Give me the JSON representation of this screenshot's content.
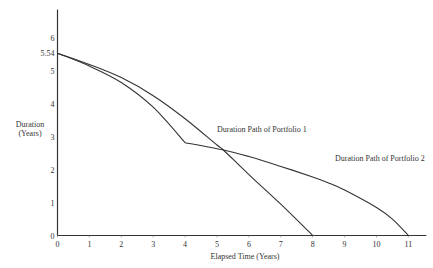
{
  "chart_data": {
    "type": "line",
    "title": "",
    "xlabel": "Elapsed Time (Years)",
    "ylabel_line1": "Duration",
    "ylabel_line2": "(Years)",
    "xlim": [
      0,
      11.5
    ],
    "ylim": [
      0,
      6.5
    ],
    "grid": false,
    "x_ticks": [
      0,
      1,
      2,
      3,
      4,
      5,
      6,
      7,
      8,
      9,
      10,
      11
    ],
    "x_tick_labels": [
      "0",
      "1",
      "2",
      "3",
      "4",
      "5",
      "6",
      "7",
      "8",
      "9",
      "10",
      "11"
    ],
    "y_ticks": [
      0,
      1,
      2,
      3,
      4,
      5,
      5.54,
      6
    ],
    "y_tick_labels": [
      "0",
      "1",
      "2",
      "3",
      "4",
      "5",
      "5.54",
      "6"
    ],
    "series": [
      {
        "name": "Duration Path of Portfolio 1",
        "x": [
          0,
          1,
          2,
          3,
          4,
          5,
          5.2,
          6,
          7,
          8
        ],
        "y": [
          5.54,
          5.2,
          4.8,
          4.25,
          3.55,
          2.75,
          2.6,
          1.85,
          0.95,
          0
        ]
      },
      {
        "name": "Duration Path of Portfolio 2",
        "x": [
          0,
          1,
          2,
          3,
          4,
          5.2,
          6,
          7,
          8,
          8.5,
          9,
          10,
          10.5,
          11
        ],
        "y": [
          5.54,
          5.15,
          4.65,
          3.9,
          2.82,
          2.6,
          2.4,
          2.1,
          1.78,
          1.6,
          1.38,
          0.85,
          0.5,
          0
        ]
      }
    ],
    "annotations": [
      {
        "text": "Duration Path of Portfolio 1",
        "x": 5.0,
        "y": 3.15
      },
      {
        "text": "Duration Path of Portfolio 2",
        "x": 8.7,
        "y": 2.25
      }
    ]
  }
}
